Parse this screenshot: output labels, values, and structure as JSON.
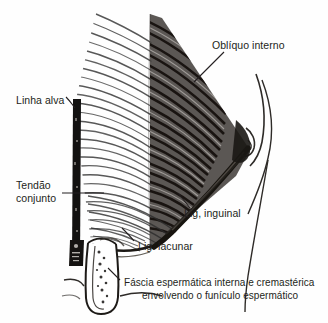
{
  "figure": {
    "type": "anatomical-line-drawing",
    "language": "pt-BR",
    "background_color": "#fefefe",
    "ink_color": "#231f20"
  },
  "labels": {
    "obliquo_interno": "Oblíquo interno",
    "linha_alva": "Linha alva",
    "tendao_line1": "Tendão",
    "tendao_line2": "conjunto",
    "lig_inguinal": "Lig, inguinal",
    "lig_lacunar": "Lig. lacunar",
    "fascia_line1": "Fáscia espermática interna e cremastérica",
    "fascia_line2": "envolvendo o funículo espermático"
  },
  "structures": {
    "obliquo_interno": "internal-oblique-muscle",
    "linha_alva": "linea-alba",
    "tendao_conjunto": "conjoint-tendon",
    "lig_inguinal": "inguinal-ligament",
    "lig_lacunar": "lacunar-ligament",
    "funiculo": "spermatic-cord"
  }
}
